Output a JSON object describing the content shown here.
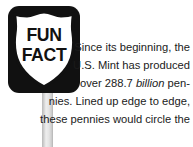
{
  "sign": {
    "label_line1": "FUN",
    "label_line2": "FACT",
    "shape": "us-route-shield",
    "plaque_color": "#111111",
    "shield_fill": "#ffffff",
    "post_color": "#d8d8d8"
  },
  "fact": {
    "lines": [
      "Since its beginning, the",
      "U.S. Mint has produced",
      "over 288.7 |billion| pen-",
      "nies. Lined up edge to edge,",
      "these pennies would circle the"
    ],
    "full_text": "Since its beginning, the U.S. Mint has produced over 288.7 billion pennies. Lined up edge to edge, these pennies would circle the",
    "emphasis_word": "billion",
    "value": "288.7 billion",
    "subject": "U.S. Mint pennies",
    "text_color": "#1b1b1b"
  },
  "page": {
    "background": "#ffffff"
  }
}
